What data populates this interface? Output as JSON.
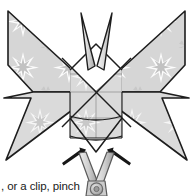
{
  "page": {
    "width": 193,
    "height": 196,
    "background": "#ffffff"
  },
  "caption": {
    "text": ", or a clip, pinch"
  },
  "figure": {
    "paper": {
      "fill": "#d5d5d5",
      "pattern_fill": "#bdbdbd",
      "pattern_highlight": "#f2f2f2",
      "outline": "#1d1d1d",
      "crease_line": "#6e6e6e"
    },
    "antennae": {
      "count": 2,
      "fill": "#e8e8e8",
      "outline": "#1d1d1d"
    },
    "arrows": {
      "count": 2,
      "fill": "#171717",
      "left_label": "push-arrow-left",
      "right_label": "push-arrow-right"
    },
    "clip": {
      "label": "binder clip",
      "body_fill": "#d0d0d0",
      "outline": "#555555",
      "pivot_fill": "#bbbbbb"
    }
  }
}
